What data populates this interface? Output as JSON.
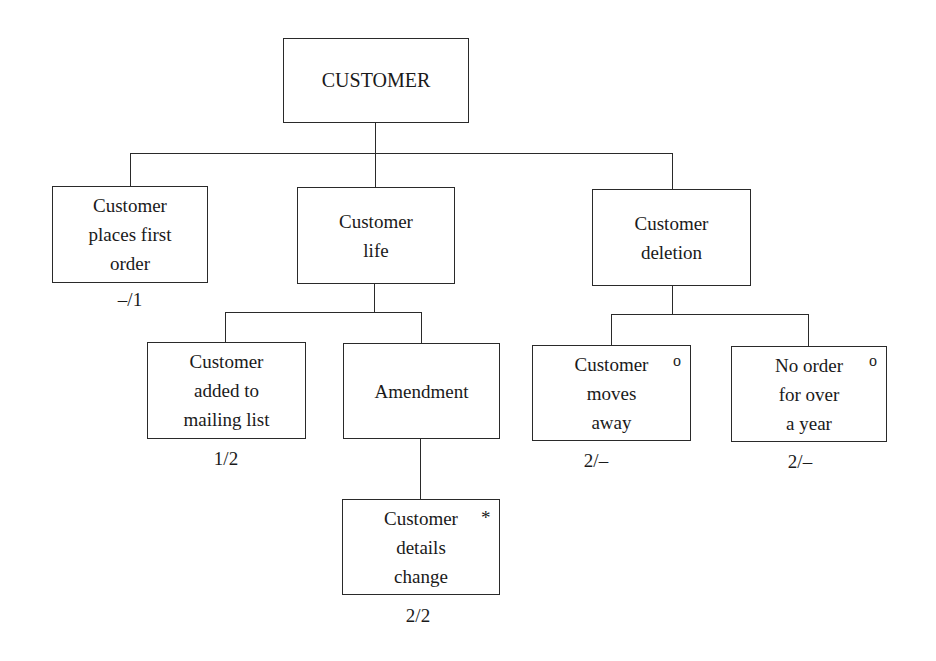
{
  "diagram": {
    "type": "structure-chart",
    "root": {
      "label": "CUSTOMER"
    },
    "nodes": [
      {
        "id": "first-order",
        "label": "Customer\nplaces first\norder",
        "annotation": "–/1",
        "marker": ""
      },
      {
        "id": "life",
        "label": "Customer\nlife",
        "annotation": "",
        "marker": ""
      },
      {
        "id": "deletion",
        "label": "Customer\ndeletion",
        "annotation": "",
        "marker": ""
      },
      {
        "id": "mailing-list",
        "label": "Customer\nadded to\nmailing list",
        "annotation": "1/2",
        "marker": ""
      },
      {
        "id": "amendment",
        "label": "Amendment",
        "annotation": "",
        "marker": ""
      },
      {
        "id": "details-change",
        "label": "Customer\ndetails\nchange",
        "annotation": "2/2",
        "marker": "*"
      },
      {
        "id": "moves-away",
        "label": "Customer\nmoves\naway",
        "annotation": "2/–",
        "marker": "o"
      },
      {
        "id": "no-order",
        "label": "No order\nfor over\na year",
        "annotation": "2/–",
        "marker": "o"
      }
    ],
    "edges": [
      [
        "CUSTOMER",
        "first-order"
      ],
      [
        "CUSTOMER",
        "life"
      ],
      [
        "CUSTOMER",
        "deletion"
      ],
      [
        "life",
        "mailing-list"
      ],
      [
        "life",
        "amendment"
      ],
      [
        "amendment",
        "details-change"
      ],
      [
        "deletion",
        "moves-away"
      ],
      [
        "deletion",
        "no-order"
      ]
    ]
  }
}
